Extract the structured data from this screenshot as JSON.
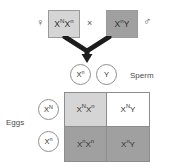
{
  "diagram": {
    "cross_symbol": "×",
    "parents": {
      "mother": {
        "genotype_base": "X",
        "genotype_allele_1": "N",
        "genotype_x2": "X",
        "genotype_allele_2": "n",
        "genotype_text": "XNXn",
        "sex_symbol": "♀",
        "sex_symbol_name": "female-venus-symbol",
        "fill": "#d5d5d5"
      },
      "father": {
        "genotype_base": "X",
        "genotype_allele_1": "n",
        "genotype_y": "Y",
        "genotype_text": "XnY",
        "sex_symbol": "♂",
        "sex_symbol_name": "male-mars-symbol",
        "fill": "#a0a0a0"
      }
    },
    "gametes": {
      "sperm_label": "Sperm",
      "eggs_label": "Eggs",
      "sperm": [
        {
          "base": "X",
          "allele": "n"
        },
        {
          "base": "Y",
          "allele": ""
        }
      ],
      "eggs": [
        {
          "base": "X",
          "allele": "N"
        },
        {
          "base": "X",
          "allele": "n"
        }
      ]
    },
    "punnett": {
      "column_headers": [
        "Xn",
        "Y"
      ],
      "row_headers": [
        "XN",
        "Xn"
      ],
      "cells": [
        {
          "id": "offspring-carrier-female",
          "parts": [
            {
              "base": "X",
              "sup": "N"
            },
            {
              "base": "X",
              "sup": "n"
            }
          ],
          "text": "XNXn",
          "fill": "fill-light"
        },
        {
          "id": "offspring-normal-male",
          "parts": [
            {
              "base": "X",
              "sup": "N"
            },
            {
              "base": "Y",
              "sup": ""
            }
          ],
          "text": "XNY",
          "fill": "fill-white"
        },
        {
          "id": "offspring-affected-female",
          "parts": [
            {
              "base": "X",
              "sup": "n"
            },
            {
              "base": "X",
              "sup": "n"
            }
          ],
          "text": "XnXn",
          "fill": "fill-dark"
        },
        {
          "id": "offspring-affected-male",
          "parts": [
            {
              "base": "X",
              "sup": "n"
            },
            {
              "base": "Y",
              "sup": ""
            }
          ],
          "text": "XnY",
          "fill": "fill-dark"
        }
      ]
    },
    "colors": {
      "light_gray": "#d5d5d5",
      "dark_gray": "#a0a0a0",
      "white": "#ffffff",
      "outline": "#8d8d8d",
      "text": "#2f2f2f"
    }
  }
}
